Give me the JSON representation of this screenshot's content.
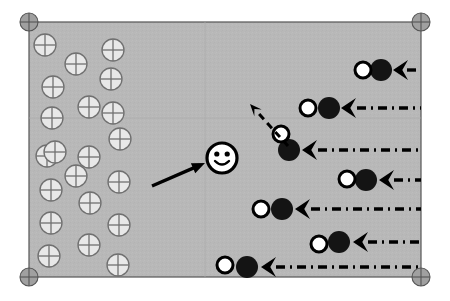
{
  "figure": {
    "type": "diagram",
    "background_color": "#ffffff",
    "panel": {
      "name": "simulation-domain",
      "x": 29,
      "y": 22,
      "width": 392,
      "height": 255,
      "fill_color": "#b8b8b8",
      "border_color": "#555555",
      "border_width": 1.2,
      "internal_gridlines": [
        {
          "orientation": "horizontal",
          "y": 118
        },
        {
          "orientation": "vertical",
          "x": 205
        }
      ],
      "gridline_color": "#aaaaaa"
    },
    "corner_markers": {
      "name": "crosshair-marker",
      "radius": 9,
      "fill_color": "#a0a0a0",
      "stroke_color": "#555555",
      "positions": [
        {
          "label": "top-left",
          "x": 29,
          "y": 22
        },
        {
          "label": "top-right",
          "x": 421,
          "y": 22
        },
        {
          "label": "bottom-left",
          "x": 29,
          "y": 277
        },
        {
          "label": "bottom-right",
          "x": 421,
          "y": 277
        }
      ]
    },
    "crossed_circles": {
      "name": "crossed-circle-glyph",
      "label": "fixed lattice site",
      "radius": 11,
      "fill_color": "#e8e8e8",
      "stroke_color": "#707070",
      "stroke_width": 1.3,
      "count": 21,
      "positions": [
        {
          "x": 45,
          "y": 45
        },
        {
          "x": 76,
          "y": 64
        },
        {
          "x": 113,
          "y": 50
        },
        {
          "x": 53,
          "y": 87
        },
        {
          "x": 111,
          "y": 79
        },
        {
          "x": 89,
          "y": 107
        },
        {
          "x": 52,
          "y": 118
        },
        {
          "x": 120,
          "y": 139
        },
        {
          "x": 47,
          "y": 156
        },
        {
          "x": 89,
          "y": 157
        },
        {
          "x": 119,
          "y": 182
        },
        {
          "x": 51,
          "y": 190
        },
        {
          "x": 90,
          "y": 203
        },
        {
          "x": 51,
          "y": 223
        },
        {
          "x": 119,
          "y": 225
        },
        {
          "x": 89,
          "y": 245
        },
        {
          "x": 49,
          "y": 256
        },
        {
          "x": 118,
          "y": 265
        },
        {
          "x": 76,
          "y": 176
        },
        {
          "x": 55,
          "y": 152
        },
        {
          "x": 113,
          "y": 113
        }
      ]
    },
    "smiley": {
      "name": "smiley-face-marker",
      "label": "tracked particle",
      "x": 222,
      "y": 158,
      "radius": 15,
      "fill_color": "#ffffff",
      "stroke_color": "#000000",
      "stroke_width": 3.2,
      "eye_radius": 2.6,
      "eye_offset_x": 5.2,
      "eye_offset_y": -4.0,
      "mouth_width": 14
    },
    "solid_arrow": {
      "name": "solid-pointer-arrow",
      "label": "pointer to tracked particle",
      "x1": 152,
      "y1": 186,
      "x2": 205,
      "y2": 163,
      "color": "#000000",
      "width": 3.4,
      "head_length": 13,
      "head_width": 11
    },
    "dashed_arrow": {
      "name": "dashed-velocity-arrow",
      "label": "velocity vector",
      "x1": 288,
      "y1": 146,
      "x2": 250,
      "y2": 104,
      "color": "#000000",
      "width": 3.0,
      "dash_pattern": "7,5",
      "head_length": 12,
      "head_width": 10
    },
    "pair_rows": {
      "name": "particle-pair-row",
      "white_circle_radius": 8,
      "white_fill_color": "#ffffff",
      "white_stroke_color": "#000000",
      "white_stroke_width": 3.0,
      "dark_circle_radius": 11,
      "dark_fill_color": "#141414",
      "arrow_color": "#000000",
      "trail_color": "#000000",
      "trail_width": 3.4,
      "trail_dash_pattern": "9,5,2,5",
      "trail_end_x": 421,
      "rows": [
        {
          "index": 1,
          "label": "row-1",
          "white_x": 363,
          "white_y": 70,
          "dark_x": 381,
          "dark_y": 70,
          "arrow_tip_x": 393,
          "arrow_tail_x": 412,
          "y": 70,
          "trail_start_x": 407
        },
        {
          "index": 2,
          "label": "row-2",
          "white_x": 308,
          "white_y": 108,
          "dark_x": 329,
          "dark_y": 108,
          "arrow_tip_x": 341,
          "arrow_tail_x": 362,
          "y": 108,
          "trail_start_x": 357
        },
        {
          "index": 3,
          "label": "row-3",
          "white_x": 281,
          "white_y": 134,
          "dark_x": 289,
          "dark_y": 150,
          "arrow_tip_x": 302,
          "arrow_tail_x": 323,
          "y": 150,
          "trail_start_x": 318
        },
        {
          "index": 4,
          "label": "row-4",
          "white_x": 347,
          "white_y": 179,
          "dark_x": 366,
          "dark_y": 180,
          "arrow_tip_x": 379,
          "arrow_tail_x": 399,
          "y": 180,
          "trail_start_x": 394
        },
        {
          "index": 5,
          "label": "row-5",
          "white_x": 261,
          "white_y": 209,
          "dark_x": 282,
          "dark_y": 209,
          "arrow_tip_x": 295,
          "arrow_tail_x": 316,
          "y": 209,
          "trail_start_x": 311
        },
        {
          "index": 6,
          "label": "row-6",
          "white_x": 319,
          "white_y": 244,
          "dark_x": 339,
          "dark_y": 242,
          "arrow_tip_x": 353,
          "arrow_tail_x": 373,
          "y": 242,
          "trail_start_x": 368
        },
        {
          "index": 7,
          "label": "row-7",
          "white_x": 225,
          "white_y": 265,
          "dark_x": 247,
          "dark_y": 267,
          "arrow_tip_x": 261,
          "arrow_tail_x": 281,
          "y": 267,
          "trail_start_x": 276
        }
      ]
    }
  }
}
